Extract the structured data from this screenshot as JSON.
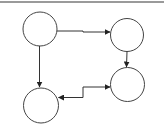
{
  "diagram": {
    "type": "directed-graph",
    "colors": {
      "background": "#ffffff",
      "stroke": "#333333",
      "border": "#9a9a9a"
    },
    "nodes": [
      {
        "id": "A",
        "label": "",
        "cx": 40,
        "cy": 29,
        "r": 17
      },
      {
        "id": "B",
        "label": "",
        "cx": 127,
        "cy": 35,
        "r": 16
      },
      {
        "id": "C",
        "label": "",
        "cx": 127,
        "cy": 84,
        "r": 17
      },
      {
        "id": "D",
        "label": "",
        "cx": 41,
        "cy": 105,
        "r": 17
      }
    ],
    "edges": [
      {
        "from": "A",
        "to": "B",
        "direction": "forward"
      },
      {
        "from": "A",
        "to": "D",
        "direction": "forward"
      },
      {
        "from": "B",
        "to": "C",
        "direction": "forward"
      },
      {
        "from": "D",
        "to": "C",
        "direction": "bidirectional"
      }
    ]
  }
}
